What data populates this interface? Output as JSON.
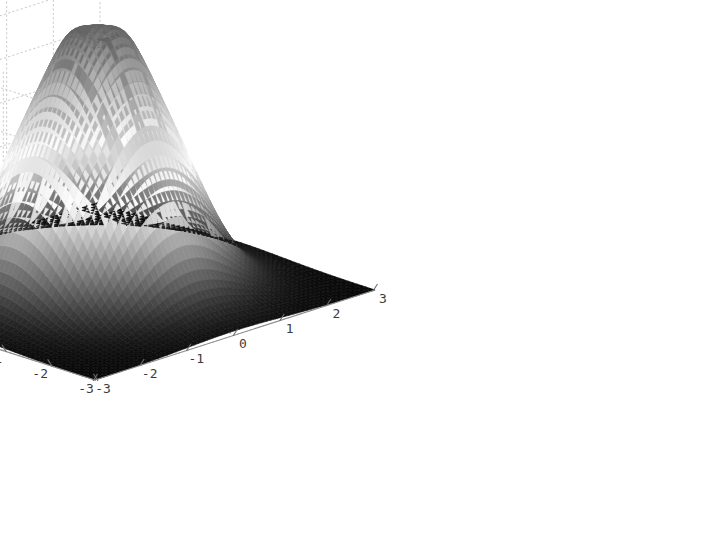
{
  "figure": {
    "background_color": "#ffffff",
    "axis_color": "#8c8c8c",
    "grid_color": "#c9c9c9",
    "label_color": "#3c3c3c",
    "grid_style": "dotted"
  },
  "axes": {
    "z": {
      "label": "",
      "ticks": [
        "0",
        "0.05",
        "0.1",
        "0.15",
        "0.2",
        "0.25",
        "0.3"
      ],
      "values": [
        0,
        0.05,
        0.1,
        0.15,
        0.2,
        0.25,
        0.3
      ],
      "range": [
        0,
        0.32
      ]
    },
    "x": {
      "label": "",
      "ticks": [
        "-3",
        "-2",
        "-1",
        "0",
        "1",
        "2",
        "3"
      ],
      "values": [
        -3,
        -2,
        -1,
        0,
        1,
        2,
        3
      ],
      "range": [
        -3,
        3
      ]
    },
    "y": {
      "label": "",
      "ticks": [
        "3",
        "2",
        "1",
        "0",
        "-1",
        "-2",
        "-3"
      ],
      "values": [
        3,
        2,
        1,
        0,
        -1,
        -2,
        -3
      ],
      "range": [
        -3,
        3
      ]
    }
  },
  "chart_data": {
    "type": "surface",
    "title": "",
    "xlabel": "",
    "ylabel": "",
    "zlabel": "",
    "xlim": [
      -3,
      3
    ],
    "ylim": [
      -3,
      3
    ],
    "zlim": [
      0,
      0.32
    ],
    "grid": true,
    "legend": "none",
    "colormap": "gray",
    "shading": "faceted",
    "view": {
      "azimuth": -37.5,
      "elevation": 30
    },
    "surface_description": "Radially symmetric bell-shaped (bivariate-Gaussian-like) surface peaking near the origin with a small flat crater/dimple at the summit; value decays to ~0 at the domain corners.",
    "peak_value": 0.32,
    "peak_location": [
      0,
      0
    ],
    "x": [
      -3,
      -2.5,
      -2,
      -1.5,
      -1,
      -0.5,
      0,
      0.5,
      1,
      1.5,
      2,
      2.5,
      3
    ],
    "y": [
      -3,
      -2.5,
      -2,
      -1.5,
      -1,
      -0.5,
      0,
      0.5,
      1,
      1.5,
      2,
      2.5,
      3
    ],
    "z_rows": [
      [
        0.0,
        0.0,
        0.0,
        0.001,
        0.001,
        0.001,
        0.001,
        0.001,
        0.001,
        0.001,
        0.0,
        0.0,
        0.0
      ],
      [
        0.0,
        0.001,
        0.002,
        0.004,
        0.006,
        0.007,
        0.008,
        0.007,
        0.006,
        0.004,
        0.002,
        0.001,
        0.0
      ],
      [
        0.0,
        0.002,
        0.006,
        0.014,
        0.023,
        0.03,
        0.032,
        0.03,
        0.023,
        0.014,
        0.006,
        0.002,
        0.0
      ],
      [
        0.001,
        0.004,
        0.014,
        0.034,
        0.058,
        0.076,
        0.082,
        0.076,
        0.058,
        0.034,
        0.014,
        0.004,
        0.001
      ],
      [
        0.001,
        0.006,
        0.023,
        0.058,
        0.1,
        0.131,
        0.141,
        0.131,
        0.1,
        0.058,
        0.023,
        0.006,
        0.001
      ],
      [
        0.001,
        0.007,
        0.03,
        0.076,
        0.131,
        0.225,
        0.29,
        0.225,
        0.131,
        0.076,
        0.03,
        0.007,
        0.001
      ],
      [
        0.001,
        0.008,
        0.032,
        0.082,
        0.141,
        0.29,
        0.318,
        0.29,
        0.141,
        0.082,
        0.032,
        0.008,
        0.001
      ],
      [
        0.001,
        0.007,
        0.03,
        0.076,
        0.131,
        0.225,
        0.29,
        0.225,
        0.131,
        0.076,
        0.03,
        0.007,
        0.001
      ],
      [
        0.001,
        0.006,
        0.023,
        0.058,
        0.1,
        0.131,
        0.141,
        0.131,
        0.1,
        0.058,
        0.023,
        0.006,
        0.001
      ],
      [
        0.001,
        0.004,
        0.014,
        0.034,
        0.058,
        0.076,
        0.082,
        0.076,
        0.058,
        0.034,
        0.014,
        0.004,
        0.001
      ],
      [
        0.0,
        0.002,
        0.006,
        0.014,
        0.023,
        0.03,
        0.032,
        0.03,
        0.023,
        0.014,
        0.006,
        0.002,
        0.0
      ],
      [
        0.0,
        0.001,
        0.002,
        0.004,
        0.006,
        0.007,
        0.008,
        0.007,
        0.006,
        0.004,
        0.002,
        0.001,
        0.0
      ],
      [
        0.0,
        0.0,
        0.0,
        0.001,
        0.001,
        0.001,
        0.001,
        0.001,
        0.001,
        0.001,
        0.0,
        0.0,
        0.0
      ]
    ]
  }
}
